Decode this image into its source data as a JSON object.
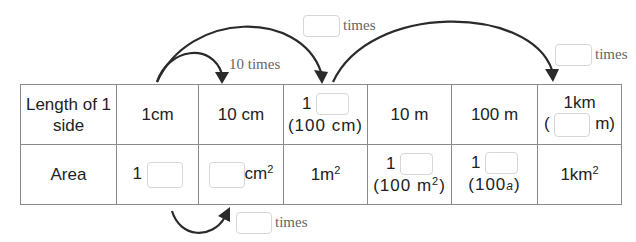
{
  "arrows": {
    "top_small": {
      "label": "10 times"
    },
    "top_large_left": {
      "label": "times",
      "answer": ""
    },
    "top_large_right": {
      "label": "times",
      "answer": ""
    },
    "bottom": {
      "label": "times",
      "answer": ""
    }
  },
  "table": {
    "rows": [
      {
        "header": [
          "Length of 1",
          "side"
        ],
        "cells": [
          {
            "text": "1cm"
          },
          {
            "text": "10 cm"
          },
          {
            "prefix": "1",
            "answer": "",
            "note": "(100 cm)"
          },
          {
            "text": "10 m"
          },
          {
            "text": "100 m"
          },
          {
            "top": "1km",
            "prefix": "(",
            "answer": "",
            "suffix": "m)"
          }
        ]
      },
      {
        "header": [
          "Area"
        ],
        "cells": [
          {
            "prefix": "1",
            "answer": ""
          },
          {
            "answer": "",
            "suffix": "cm",
            "sup": "2"
          },
          {
            "text": "1m",
            "sup": "2"
          },
          {
            "prefix": "1",
            "answer": "",
            "note": "(100 m",
            "note_sup": "2",
            "note_end": ")"
          },
          {
            "prefix": "1",
            "answer": "",
            "note": "(100",
            "note_unit": "a",
            "note_end": ")"
          },
          {
            "text": "1km",
            "sup": "2"
          }
        ]
      }
    ]
  },
  "colors": {
    "arrow": "#2a2a2a",
    "grid": "#8a8a8a",
    "box_border": "#d6d6d6",
    "label": "#666666"
  }
}
